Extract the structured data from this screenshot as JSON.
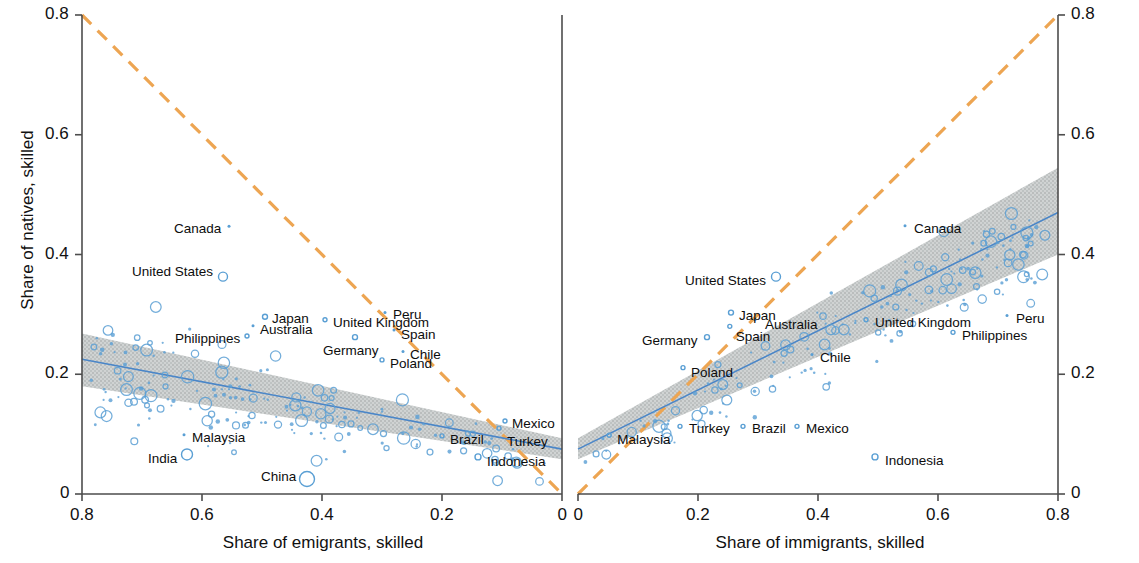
{
  "figure": {
    "background": "#ffffff",
    "marker_color": "#5a9fd4",
    "trend_color": "#4a86c8",
    "band_color": "#b9bcbc",
    "reference_color": "#eda552",
    "axis_color": "#4d4d4d"
  },
  "axes": {
    "y_label_left": "Share of natives, skilled",
    "y_label_right": "Share of natives, skilled",
    "x_label_left": "Share of emigrants, skilled",
    "x_label_right": "Share of immigrants, skilled",
    "y_ticks": [
      "0.8",
      "0.6",
      "0.4",
      "0.2",
      "0"
    ],
    "x_ticks_left": [
      "0.8",
      "0.6",
      "0.4",
      "0.2",
      "0"
    ],
    "x_ticks_right": [
      "0",
      "0.2",
      "0.4",
      "0.6",
      "0.8"
    ]
  },
  "chart_data": {
    "type": "scatter",
    "title": "",
    "xlabel_left": "Share of emigrants, skilled",
    "xlabel_right": "Share of immigrants, skilled",
    "ylabel": "Share of natives, skilled",
    "xlim_left": [
      0.8,
      0.0
    ],
    "xlim_right": [
      0.0,
      0.8
    ],
    "ylim": [
      0.0,
      0.8
    ],
    "grid": false,
    "legend": "none",
    "panels": [
      {
        "name": "emigrants",
        "x_direction": "reversed",
        "reference_line": {
          "style": "dashed",
          "color": "#eda552",
          "from": [
            0.8,
            0.8
          ],
          "to": [
            0.0,
            0.0
          ],
          "note": "45-degree line"
        },
        "fit_line": {
          "color": "#4a86c8",
          "intercept_at_x08": 0.225,
          "value_at_x0": 0.075,
          "band": "95% confidence"
        },
        "labeled_points": [
          {
            "label": "Canada",
            "x": 0.555,
            "y": 0.447,
            "size": 3
          },
          {
            "label": "United States",
            "x": 0.565,
            "y": 0.363,
            "size": 9
          },
          {
            "label": "Japan",
            "x": 0.495,
            "y": 0.296,
            "size": 5
          },
          {
            "label": "Australia",
            "x": 0.515,
            "y": 0.281,
            "size": 3
          },
          {
            "label": "Philippines",
            "x": 0.525,
            "y": 0.264,
            "size": 4
          },
          {
            "label": "United Kingdom",
            "x": 0.395,
            "y": 0.291,
            "size": 4
          },
          {
            "label": "Peru",
            "x": 0.295,
            "y": 0.303,
            "size": 3
          },
          {
            "label": "Spain",
            "x": 0.28,
            "y": 0.274,
            "size": 3
          },
          {
            "label": "Germany",
            "x": 0.345,
            "y": 0.262,
            "size": 5
          },
          {
            "label": "Chile",
            "x": 0.265,
            "y": 0.238,
            "size": 3
          },
          {
            "label": "Poland",
            "x": 0.3,
            "y": 0.224,
            "size": 4
          },
          {
            "label": "Mexico",
            "x": 0.095,
            "y": 0.122,
            "size": 4
          },
          {
            "label": "Turkey",
            "x": 0.105,
            "y": 0.11,
            "size": 4
          },
          {
            "label": "Brazil",
            "x": 0.2,
            "y": 0.097,
            "size": 4
          },
          {
            "label": "Malaysia",
            "x": 0.63,
            "y": 0.099,
            "size": 3
          },
          {
            "label": "India",
            "x": 0.625,
            "y": 0.066,
            "size": 11
          },
          {
            "label": "China",
            "x": 0.425,
            "y": 0.025,
            "size": 15
          },
          {
            "label": "Indonesia",
            "x": 0.14,
            "y": 0.062,
            "size": 6
          }
        ]
      },
      {
        "name": "immigrants",
        "x_direction": "normal",
        "reference_line": {
          "style": "dashed",
          "color": "#eda552",
          "from": [
            0.0,
            0.0
          ],
          "to": [
            0.8,
            0.8
          ],
          "note": "45-degree line"
        },
        "fit_line": {
          "color": "#4a86c8",
          "value_at_x0": 0.075,
          "value_at_x08": 0.47,
          "band": "95% confidence"
        },
        "labeled_points": [
          {
            "label": "Canada",
            "x": 0.545,
            "y": 0.448,
            "size": 3
          },
          {
            "label": "United States",
            "x": 0.33,
            "y": 0.363,
            "size": 9
          },
          {
            "label": "Japan",
            "x": 0.255,
            "y": 0.303,
            "size": 5
          },
          {
            "label": "Australia",
            "x": 0.295,
            "y": 0.291,
            "size": 3
          },
          {
            "label": "Spain",
            "x": 0.253,
            "y": 0.28,
            "size": 4
          },
          {
            "label": "Germany",
            "x": 0.215,
            "y": 0.262,
            "size": 5
          },
          {
            "label": "United Kingdom",
            "x": 0.48,
            "y": 0.291,
            "size": 4
          },
          {
            "label": "Peru",
            "x": 0.715,
            "y": 0.298,
            "size": 3
          },
          {
            "label": "Philippines",
            "x": 0.625,
            "y": 0.27,
            "size": 4
          },
          {
            "label": "Chile",
            "x": 0.39,
            "y": 0.233,
            "size": 3
          },
          {
            "label": "Poland",
            "x": 0.175,
            "y": 0.211,
            "size": 4
          },
          {
            "label": "Turkey",
            "x": 0.17,
            "y": 0.113,
            "size": 4
          },
          {
            "label": "Brazil",
            "x": 0.275,
            "y": 0.113,
            "size": 4
          },
          {
            "label": "Mexico",
            "x": 0.365,
            "y": 0.113,
            "size": 4
          },
          {
            "label": "Malaysia",
            "x": 0.052,
            "y": 0.098,
            "size": 4
          },
          {
            "label": "Indonesia",
            "x": 0.495,
            "y": 0.062,
            "size": 6
          }
        ]
      }
    ]
  }
}
